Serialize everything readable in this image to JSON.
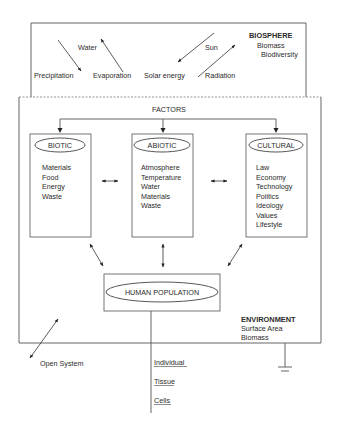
{
  "biosphere": {
    "title": "BIOSPHERE",
    "items": [
      "Biomass",
      "Biodiversity"
    ],
    "labels": {
      "water": "Water",
      "precipitation": "Precipitation",
      "evaporation": "Evaporation",
      "sun": "Sun",
      "solar_energy": "Solar energy",
      "radiation": "Radiation"
    }
  },
  "factors": {
    "title": "FACTORS",
    "boxes": [
      {
        "name": "BIOTIC",
        "items": [
          "Materials",
          "Food",
          "Energy",
          "Waste"
        ]
      },
      {
        "name": "ABIOTIC",
        "items": [
          "Atmosphere",
          "Temperature",
          "Water",
          "Materials",
          "Waste"
        ]
      },
      {
        "name": "CULTURAL",
        "items": [
          "Law",
          "Economy",
          "Technology",
          "Politics",
          "Ideology",
          "Values",
          "Lifestyle"
        ]
      }
    ]
  },
  "human_population": {
    "label": "HUMAN POPULATION"
  },
  "environment": {
    "title": "ENVIRONMENT",
    "items": [
      "Surface Area",
      "Biomass"
    ]
  },
  "open_system": {
    "label": "Open System"
  },
  "levels": [
    "Individual",
    "Tissue",
    "Cells"
  ]
}
